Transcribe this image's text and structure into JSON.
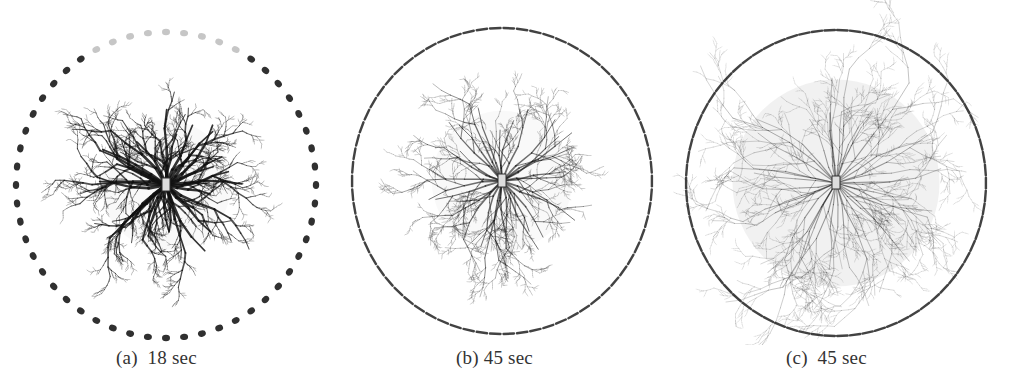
{
  "figure": {
    "panels": [
      {
        "id": "a",
        "caption": "(a)  18 sec",
        "cx": 166,
        "cy": 185,
        "r": 150,
        "density": "dense",
        "spread": 72,
        "rays": 34,
        "darkness": 0.85,
        "dot_style": "large-dots",
        "dot_count": 52
      },
      {
        "id": "b",
        "caption": "(b) 45 sec",
        "cx": 502,
        "cy": 181,
        "r": 150,
        "density": "medium",
        "spread": 78,
        "rays": 30,
        "darkness": 0.6,
        "dot_style": "dashes",
        "dot_count": 70
      },
      {
        "id": "c",
        "caption": "(c)  45 sec",
        "cx": 836,
        "cy": 183,
        "r": 150,
        "density": "diffuse",
        "spread": 115,
        "rays": 40,
        "darkness": 0.4,
        "dot_style": "dashes",
        "dot_count": 74
      }
    ]
  }
}
